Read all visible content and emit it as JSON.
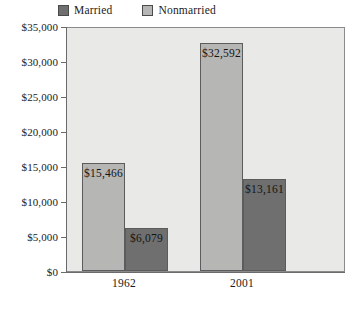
{
  "chart_data": {
    "type": "bar",
    "title": "",
    "xlabel": "",
    "ylabel": "",
    "categories": [
      "1962",
      "2001"
    ],
    "series": [
      {
        "name": "Married",
        "color": "#6f6f6f",
        "values": [
          6079,
          13161
        ],
        "value_labels": [
          "$6,079",
          "$13,161"
        ]
      },
      {
        "name": "Nonmarried",
        "color": "#b6b6b4",
        "values": [
          15466,
          32592
        ],
        "value_labels": [
          "$15,466",
          "$32,592"
        ]
      }
    ],
    "draw_order": [
      "Nonmarried",
      "Married"
    ],
    "ylim": [
      0,
      35000
    ],
    "ytick_values": [
      0,
      5000,
      10000,
      15000,
      20000,
      25000,
      30000,
      35000
    ],
    "ytick_labels": [
      "$0",
      "$5,000",
      "$10,000",
      "$15,000",
      "$20,000",
      "$25,000",
      "$30,000",
      "$35,000"
    ],
    "grid": false,
    "legend_position": "top-left",
    "plot_background": "#e9e9e7",
    "axis_color": "#6a6a6a",
    "bar_border_color": "#5c5c5c"
  },
  "legend": {
    "items": [
      {
        "label": "Married",
        "color": "#6f6f6f"
      },
      {
        "label": "Nonmarried",
        "color": "#b6b6b4"
      }
    ]
  }
}
